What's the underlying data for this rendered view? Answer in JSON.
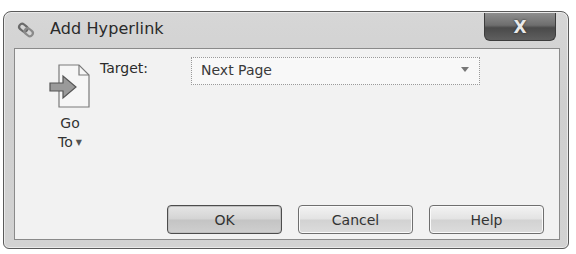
{
  "window": {
    "title": "Add Hyperlink",
    "title_icon": "hyperlink-chain-icon",
    "close_label": "X"
  },
  "goto": {
    "icon": "page-arrow-icon",
    "label_line1": "Go",
    "label_line2": "To",
    "caret": "▼"
  },
  "target": {
    "label": "Target:",
    "value": "Next Page",
    "dropdown_icon": "chevron-down-icon"
  },
  "buttons": {
    "ok": "OK",
    "cancel": "Cancel",
    "help": "Help"
  }
}
